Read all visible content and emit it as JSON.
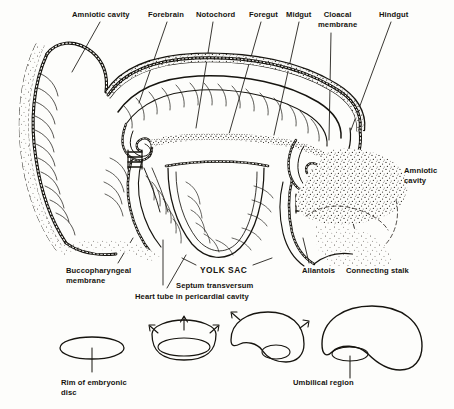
{
  "figure": {
    "background_color": "#fdfdfb",
    "ink_color": "#16140f"
  },
  "labels": {
    "top": [
      {
        "name": "amniotic-cavity-top",
        "text": "Amniotic cavity",
        "x": 72,
        "y": 10
      },
      {
        "name": "forebrain",
        "text": "Forebrain",
        "x": 148,
        "y": 10
      },
      {
        "name": "notochord",
        "text": "Notochord",
        "x": 196,
        "y": 10
      },
      {
        "name": "foregut",
        "text": "Foregut",
        "x": 249,
        "y": 10
      },
      {
        "name": "midgut",
        "text": "Midgut",
        "x": 286,
        "y": 10
      },
      {
        "name": "cloacal-membrane",
        "text": "Cloacal\nmembrane",
        "x": 318,
        "y": 10
      },
      {
        "name": "hindgut",
        "text": "Hindgut",
        "x": 379,
        "y": 10
      }
    ],
    "right": [
      {
        "name": "amniotic-cavity-right",
        "text": "Amniotic\ncavity",
        "x": 404,
        "y": 168
      }
    ],
    "bottom": [
      {
        "name": "buccopharyngeal-membrane",
        "text": "Buccopharyngeal\nmembrane",
        "x": 66,
        "y": 267
      },
      {
        "name": "yolk-sac",
        "text": "YOLK SAC",
        "x": 200,
        "y": 268
      },
      {
        "name": "septum-transversum",
        "text": "Septum transversum",
        "x": 176,
        "y": 281
      },
      {
        "name": "heart-tube",
        "text": "Heart tube in pericardial cavity",
        "x": 135,
        "y": 292
      },
      {
        "name": "allantois",
        "text": "Allantois",
        "x": 302,
        "y": 268
      },
      {
        "name": "connecting-stalk",
        "text": "Connecting stalk",
        "x": 346,
        "y": 268
      }
    ],
    "sequence": [
      {
        "name": "rim-of-embryonic-disc",
        "text": "Rim of embryonic\ndisc",
        "x": 61,
        "y": 380
      },
      {
        "name": "umbilical-region",
        "text": "Umbilical region",
        "x": 293,
        "y": 380
      }
    ]
  },
  "main_drawing": {
    "name": "sagittal-section-of-folded-embryo",
    "structures": [
      "amnion",
      "amniotic cavity",
      "forebrain",
      "notochord",
      "foregut",
      "midgut",
      "hindgut",
      "cloacal membrane",
      "buccopharyngeal membrane",
      "yolk sac",
      "septum transversum",
      "heart tube in pericardial cavity",
      "allantois",
      "connecting stalk",
      "extra-embryonic mesoderm"
    ]
  },
  "sequence_drawings": [
    {
      "name": "stage-1-flat-disc",
      "caption": "Rim of embryonic disc"
    },
    {
      "name": "stage-2-folding-cup",
      "caption": ""
    },
    {
      "name": "stage-3-deepening-fold",
      "caption": ""
    },
    {
      "name": "stage-4-umbilical-closure",
      "caption": "Umbilical region"
    }
  ]
}
